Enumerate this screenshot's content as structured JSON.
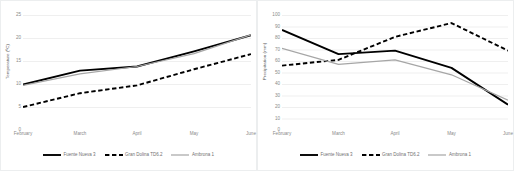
{
  "figure": {
    "panels": [
      {
        "name": "temperature",
        "chart_data": {
          "type": "line",
          "title": "",
          "xlabel": "",
          "ylabel": "Temperature (ºC)",
          "categories": [
            "February",
            "March",
            "April",
            "May",
            "June"
          ],
          "yticks": [
            0,
            5,
            10,
            15,
            20,
            25
          ],
          "ylim": [
            0,
            25
          ],
          "grid": true,
          "legend_position": "bottom",
          "series": [
            {
              "name": "Fuente Nueva 3",
              "values": [
                9.9,
                12.9,
                13.8,
                17.1,
                20.6
              ],
              "style": "solid-black"
            },
            {
              "name": "Gran Dolina TD6.2",
              "values": [
                5.0,
                8.0,
                9.7,
                13.2,
                16.5
              ],
              "style": "dashed-black"
            },
            {
              "name": "Ambrona 1",
              "values": [
                9.7,
                12.2,
                13.8,
                16.6,
                20.7
              ],
              "style": "solid-gray"
            }
          ]
        }
      },
      {
        "name": "precipitation",
        "chart_data": {
          "type": "line",
          "title": "",
          "xlabel": "",
          "ylabel": "Precipitation (mm)",
          "categories": [
            "February",
            "March",
            "April",
            "May",
            "June"
          ],
          "yticks": [
            0,
            10,
            20,
            30,
            40,
            50,
            60,
            70,
            80,
            90,
            100
          ],
          "ylim": [
            0,
            100
          ],
          "grid": true,
          "legend_position": "bottom",
          "series": [
            {
              "name": "Fuente Nueva 3",
              "values": [
                87,
                66,
                69,
                54,
                22
              ],
              "style": "solid-black"
            },
            {
              "name": "Gran Dolina TD6.2",
              "values": [
                56,
                61,
                81,
                93,
                69
              ],
              "style": "dashed-black"
            },
            {
              "name": "Ambrona 1",
              "values": [
                71,
                57,
                61,
                48,
                26
              ],
              "style": "solid-gray"
            }
          ]
        }
      }
    ],
    "colors": {
      "solid_black": "#000000",
      "dashed_black": "#000000",
      "solid_gray": "#a6a6a6",
      "gridline": "#e8e8e8",
      "tick_text": "#8a8a8a",
      "axis_title": "#595959",
      "panel_border": "#eceeef"
    }
  }
}
